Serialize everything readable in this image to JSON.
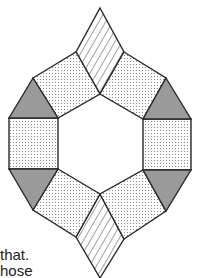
{
  "figure": {
    "colors": {
      "stroke": "#2a2a2a",
      "triangle_fill": "#9a9a9a",
      "dot_color": "#8a8a8a",
      "hatch_color": "#444444",
      "background": "#ffffff"
    },
    "shapes": {
      "rhombus_top": "100,8 124,52 100,94 76,52",
      "rhombus_bottom": "100,194 124,239 100,278 76,237",
      "square_upper_left": "33,78 76,52 100,94 58,118",
      "square_upper_right": "124,52 166,78 143,119 100,94",
      "square_left": "9,118 58,118 58,169 9,169",
      "square_right": "143,119 191,119 191,170 143,170",
      "square_lower_left": "58,169 100,194 76,237 33,210",
      "square_lower_right": "143,170 166,211 124,239 100,194",
      "triangle_upper_left": "33,78 58,118 9,118",
      "triangle_upper_right": "166,78 191,119 143,119",
      "triangle_lower_left": "9,169 58,169 33,210",
      "triangle_lower_right": "143,170 191,170 166,211"
    }
  },
  "caption": {
    "line1": "that.",
    "line2": "hose"
  }
}
